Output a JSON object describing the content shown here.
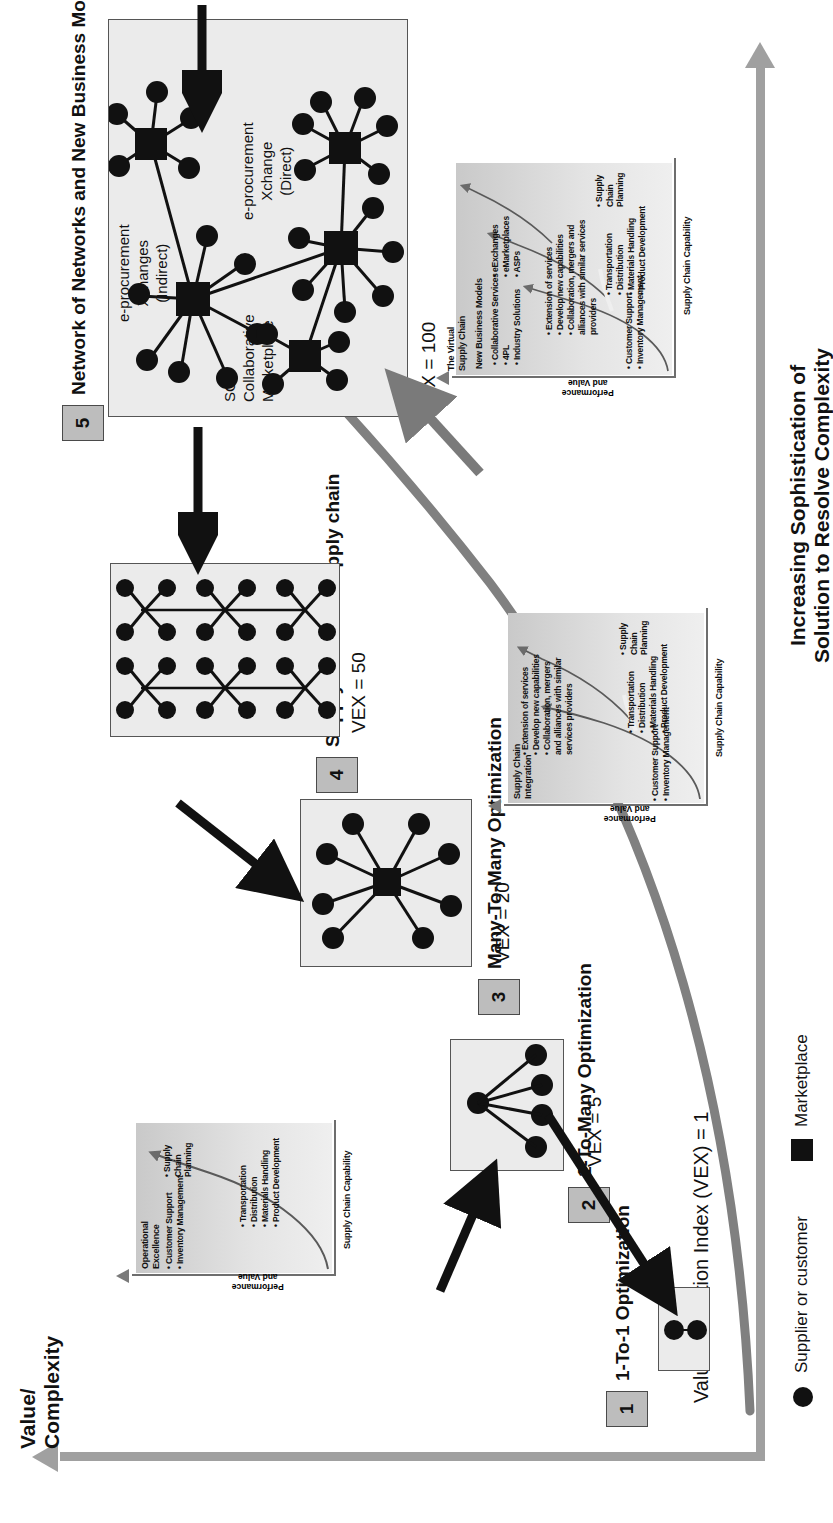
{
  "diagram": {
    "y_axis_title": "Value/\nComplexity",
    "x_axis_title_line1": "Increasing Sophistication of",
    "x_axis_title_line2": "Solution to Resolve Complexity",
    "baseline_label": "Value Extraction Index (VEX) = 1",
    "colors": {
      "axis_grey": "#a0a0a0",
      "box_fill": "#ebebeb",
      "badge_fill": "#bdbdbd",
      "node_black": "#111111",
      "inset_fill": "#d2d2d2"
    }
  },
  "legend": {
    "items": [
      {
        "marker": "circle",
        "label": "Supplier or customer"
      },
      {
        "marker": "square",
        "label": "Marketplace"
      }
    ]
  },
  "stages": [
    {
      "number": "1",
      "title": "1-To-1 Optimization",
      "vex": "",
      "topology": "one-to-one"
    },
    {
      "number": "2",
      "title": "1-To-Many Optimization",
      "vex": "VEX = 5",
      "topology": "one-to-many"
    },
    {
      "number": "3",
      "title": "Many-To-Many Optimization",
      "vex": "VEX = 20",
      "topology": "many-to-many"
    },
    {
      "number": "4",
      "title": "Supply chain vs. Supply chain",
      "vex": "VEX = 50",
      "topology": "chain-vs-chain"
    },
    {
      "number": "5",
      "title": "Network of Networks and New Business Models",
      "vex": "VEX = 100",
      "topology": "network-of-networks"
    }
  ],
  "stage5_annotations": {
    "indirect": "e-procurement\nXchanges\n(Indirect)",
    "indirect_l1": "e-procurement",
    "indirect_l2": "Xchanges",
    "indirect_l3": "(Indirect)",
    "direct_l1": "e-procurement",
    "direct_l2": "Xchange",
    "direct_l3": "(Direct)",
    "marketplace_l1": "SC",
    "marketplace_l2": "Collaborative",
    "marketplace_l3": "Marketplace"
  },
  "insets": [
    {
      "id": "inset-operational-excellence",
      "y_axis_label_l1": "Performance",
      "y_axis_label_l2": "and Value",
      "x_axis_label": "Supply Chain Capability",
      "headline_l1": "Operational",
      "headline_l2": "Excellence",
      "bullets_lower": [
        "Customer Support",
        "Inventory Management"
      ],
      "bullets_upper": [
        "Transportation",
        "Distribution",
        "Materials Handling",
        "Product Development"
      ],
      "bullets_top": [
        "Supply Chain Planning"
      ]
    },
    {
      "id": "inset-supply-chain-integration",
      "y_axis_label_l1": "Performance",
      "y_axis_label_l2": "and Value",
      "x_axis_label": "Supply Chain Capability",
      "headline_l1": "Supply Chain",
      "headline_l2": "Integration",
      "bullets_lower": [
        "Customer Support",
        "Inventory Management"
      ],
      "bullets_mid": [
        "Transportation",
        "Distribution",
        "Materials Handling",
        "Product Development"
      ],
      "bullets_upper": [
        "Extension of services",
        "Develop new capabilities",
        "Collaboration, mergers and alliances with similar services providers"
      ],
      "bullets_top": [
        "Supply Chain Planning"
      ]
    },
    {
      "id": "inset-virtual-supply-chain",
      "y_axis_label_l1": "Performance",
      "y_axis_label_l2": "and Value",
      "x_axis_label": "Supply Chain Capability",
      "headline_l1": "The Virtual",
      "headline_l2": "Supply Chain",
      "headline2_l1": "New Business Models",
      "bullets_lower": [
        "Customer Support",
        "Inventory Management"
      ],
      "bullets_mid": [
        "Transportation",
        "Distribution",
        "Materials Handling",
        "Product Development"
      ],
      "bullets_upper": [
        "Extension of services",
        "Develop new capabilities",
        "Collaboration, mergers and alliances with similar services providers"
      ],
      "bullets_newmodels_a": [
        "Collaborative Services",
        "4PL",
        "Industry Solutions"
      ],
      "bullets_newmodels_b": [
        "eExchanges",
        "eMarketplaces",
        "ASPs"
      ],
      "bullets_top": [
        "Supply Chain Planning"
      ]
    }
  ]
}
